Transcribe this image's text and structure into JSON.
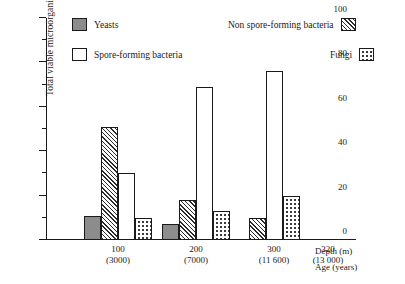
{
  "chart_data": {
    "type": "bar",
    "title": "",
    "xlabel": "Depth (m)",
    "xlabel2": "Age (years)",
    "ylabel": "Total viable microorganisms (%)",
    "ylim": [
      0,
      100
    ],
    "ytick_major": [
      0,
      20,
      40,
      60,
      80,
      100
    ],
    "ytick_minor": [
      10,
      30,
      50,
      70,
      90
    ],
    "grid": false,
    "legend_position": "top",
    "categories": [
      "100",
      "200",
      "300",
      "320"
    ],
    "category_sub": [
      "(3000)",
      "(7000)",
      "(11 600)",
      "(13 000)"
    ],
    "series": [
      {
        "name": "Yeasts",
        "pattern": "solid-gray",
        "values": [
          11,
          7,
          null,
          null
        ]
      },
      {
        "name": "Non spore-forming bacteria",
        "pattern": "diagonal-hatch",
        "values": [
          51,
          18,
          10,
          null
        ]
      },
      {
        "name": "Spore-forming bacteria",
        "pattern": "open-white",
        "values": [
          30,
          69,
          76,
          null
        ]
      },
      {
        "name": "Fungi",
        "pattern": "dotted",
        "values": [
          10,
          13,
          20,
          null
        ]
      }
    ]
  },
  "axis": {
    "y_title": "Total viable microorganisms (%)",
    "y_ticks": [
      "0",
      "20",
      "40",
      "60",
      "80",
      "100"
    ],
    "x_depth_label": "Depth (m)",
    "x_age_label": "Age (years)",
    "x_groups": [
      {
        "depth": "100",
        "age": "(3000)"
      },
      {
        "depth": "200",
        "age": "(7000)"
      },
      {
        "depth": "300",
        "age": "(11 600)"
      },
      {
        "depth": "320",
        "age": "(13 000)"
      }
    ]
  },
  "legend": {
    "yeasts": "Yeasts",
    "spore_forming": "Spore-forming bacteria",
    "non_spore_forming": "Non spore-forming bacteria",
    "fungi": "Fungi"
  },
  "colors": {
    "ink": "#1a1a1a",
    "yeasts_fill": "#8c8c8c",
    "background": "#ffffff"
  }
}
